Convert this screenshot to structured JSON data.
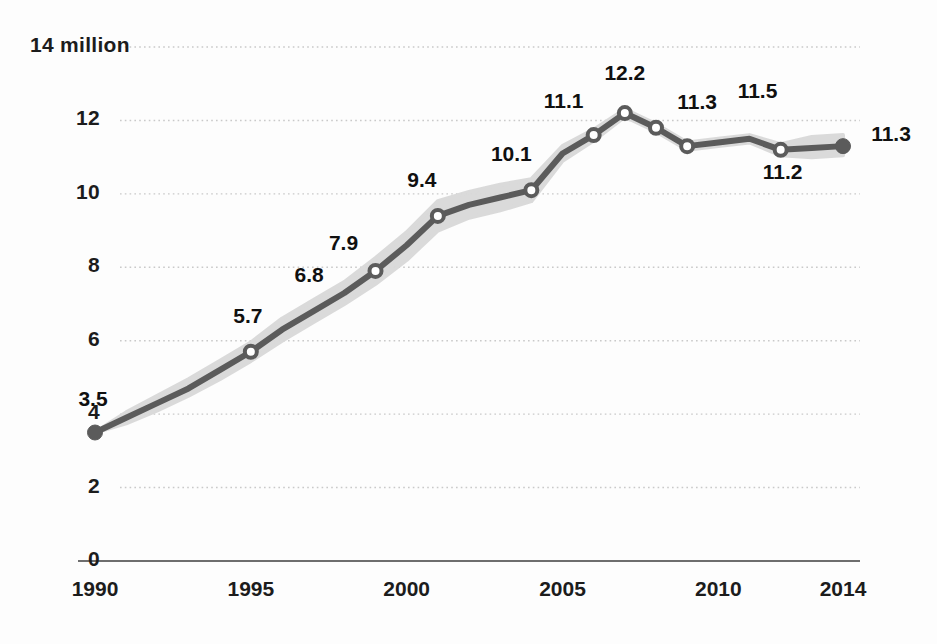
{
  "chart_data": {
    "type": "line",
    "title": "",
    "subtitle": "",
    "xlabel": "",
    "ylabel": "",
    "y_unit_label": "14 million",
    "ylim": [
      0,
      14
    ],
    "xlim": [
      1990,
      2014
    ],
    "grid": true,
    "legend": "none",
    "series": [
      {
        "name": "Population (millions)",
        "x": [
          1990,
          1991,
          1992,
          1993,
          1994,
          1995,
          1996,
          1997,
          1998,
          1999,
          2000,
          2001,
          2002,
          2003,
          2004,
          2005,
          2006,
          2007,
          2008,
          2009,
          2010,
          2011,
          2012,
          2013,
          2014
        ],
        "values": [
          3.5,
          3.9,
          4.3,
          4.7,
          5.2,
          5.7,
          6.3,
          6.8,
          7.3,
          7.9,
          8.6,
          9.4,
          9.7,
          9.9,
          10.1,
          11.1,
          11.6,
          12.2,
          11.8,
          11.3,
          11.4,
          11.5,
          11.2,
          11.25,
          11.3
        ]
      }
    ],
    "uncertainty_band": {
      "name": "confidence interval",
      "lower": [
        3.5,
        3.75,
        4.1,
        4.5,
        4.95,
        5.45,
        6.0,
        6.5,
        7.0,
        7.55,
        8.2,
        9.0,
        9.35,
        9.55,
        9.8,
        10.9,
        11.45,
        12.1,
        11.7,
        11.2,
        11.3,
        11.4,
        11.05,
        11.0,
        11.05
      ],
      "upper": [
        3.5,
        4.05,
        4.5,
        4.95,
        5.45,
        5.95,
        6.6,
        7.1,
        7.6,
        8.25,
        8.95,
        9.8,
        10.05,
        10.25,
        10.4,
        11.3,
        11.75,
        12.3,
        11.9,
        11.4,
        11.5,
        11.6,
        11.35,
        11.55,
        11.6
      ]
    },
    "marker_style": {
      "open_years": [
        1995,
        1999,
        2001,
        2004,
        2006,
        2007,
        2008,
        2009,
        2012
      ],
      "filled_years": [
        1990,
        2014
      ]
    },
    "y_ticks": [
      {
        "value": 14,
        "label": "14 million"
      },
      {
        "value": 12,
        "label": "12"
      },
      {
        "value": 10,
        "label": "10"
      },
      {
        "value": 8,
        "label": "8"
      },
      {
        "value": 6,
        "label": "6"
      },
      {
        "value": 4,
        "label": "4"
      },
      {
        "value": 2,
        "label": "2"
      },
      {
        "value": 0,
        "label": "0"
      }
    ],
    "x_ticks": [
      {
        "value": 1990,
        "label": "1990"
      },
      {
        "value": 1995,
        "label": "1995"
      },
      {
        "value": 2000,
        "label": "2000"
      },
      {
        "value": 2005,
        "label": "2005"
      },
      {
        "value": 2010,
        "label": "2010"
      },
      {
        "value": 2014,
        "label": "2014"
      }
    ],
    "data_labels": [
      {
        "year": 1990,
        "text": "3.5",
        "dx": -2,
        "dy": -34
      },
      {
        "year": 1995,
        "text": "5.7",
        "dx": -3,
        "dy": -36
      },
      {
        "year": 1997,
        "text": "6.8",
        "dx": -4,
        "dy": -36
      },
      {
        "year": 1999,
        "text": "7.9",
        "dx": -32,
        "dy": -28
      },
      {
        "year": 2001,
        "text": "9.4",
        "dx": -16,
        "dy": -36
      },
      {
        "year": 2004,
        "text": "10.1",
        "dx": -20,
        "dy": -36
      },
      {
        "year": 2006,
        "text": "11.1",
        "dx": -30,
        "dy": -34
      },
      {
        "year": 2007,
        "text": "12.2",
        "dx": 0,
        "dy": -40
      },
      {
        "year": 2009,
        "text": "11.3",
        "dx": 10,
        "dy": -44
      },
      {
        "year": 2011,
        "text": "11.5",
        "dx": 8,
        "dy": -48
      },
      {
        "year": 2012,
        "text": "11.2",
        "dx": 2,
        "dy": 22
      },
      {
        "year": 2014,
        "text": "11.3",
        "dx": 48,
        "dy": -12
      }
    ],
    "colors": {
      "line": "#5b5b5b",
      "band": "#d9d9d9",
      "marker_fill": "#ffffff",
      "marker_edge": "#5b5b5b",
      "grid": "#c9c9c9",
      "axis": "#6e6e6e",
      "text": "#141414",
      "background": "#fdfdfd"
    }
  }
}
